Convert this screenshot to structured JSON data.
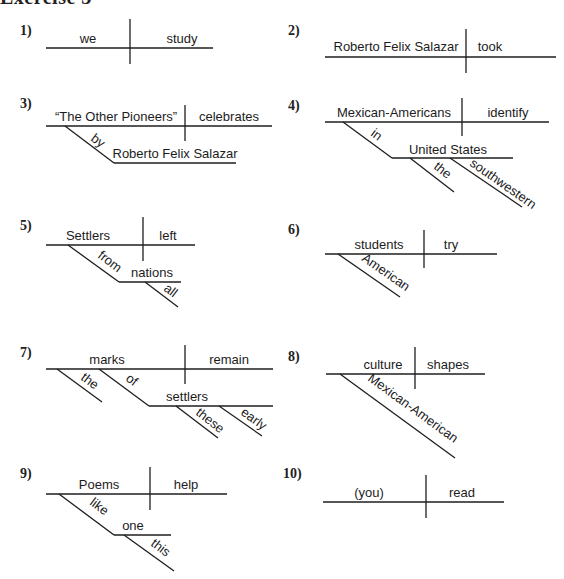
{
  "header": {
    "title": "Exercise 3"
  },
  "diagrams": [
    {
      "number": "1)",
      "subject": "we",
      "verb": "study"
    },
    {
      "number": "2)",
      "subject": "Roberto Felix Salazar",
      "verb": "took"
    },
    {
      "number": "3)",
      "subject": "“The Other Pioneers”",
      "verb": "celebrates",
      "modifiers": [
        {
          "preposition": "by",
          "object": "Roberto Felix Salazar"
        }
      ]
    },
    {
      "number": "4)",
      "subject": "Mexican-Americans",
      "verb": "identify",
      "modifiers": [
        {
          "preposition": "in",
          "object": "United States",
          "object_modifiers": [
            "the",
            "southwestern"
          ]
        }
      ]
    },
    {
      "number": "5)",
      "subject": "Settlers",
      "verb": "left",
      "modifiers": [
        {
          "preposition": "from",
          "object": "nations",
          "object_modifiers": [
            "all"
          ]
        }
      ]
    },
    {
      "number": "6)",
      "subject": "students",
      "verb": "try",
      "subject_modifiers": [
        "American"
      ]
    },
    {
      "number": "7)",
      "subject": "marks",
      "verb": "remain",
      "subject_modifiers": [
        "the"
      ],
      "modifiers": [
        {
          "preposition": "of",
          "object": "settlers",
          "object_modifiers": [
            "these",
            "early"
          ]
        }
      ]
    },
    {
      "number": "8)",
      "subject": "culture",
      "verb": "shapes",
      "subject_modifiers": [
        "Mexican-American"
      ]
    },
    {
      "number": "9)",
      "subject": "Poems",
      "verb": "help",
      "modifiers": [
        {
          "preposition": "like",
          "object": "one",
          "object_modifiers": [
            "this"
          ]
        }
      ]
    },
    {
      "number": "10)",
      "subject": "(you)",
      "verb": "read"
    }
  ]
}
